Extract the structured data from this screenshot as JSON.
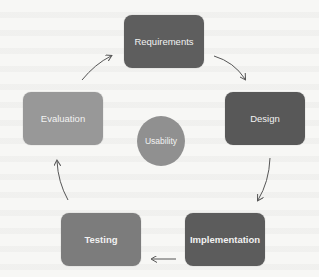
{
  "diagram": {
    "type": "cycle",
    "title": "",
    "center": {
      "label": "Usability",
      "color": "#909090"
    },
    "nodes": [
      {
        "id": "requirements",
        "label": "Requirements",
        "color": "#5e5e5e",
        "bold": false
      },
      {
        "id": "design",
        "label": "Design",
        "color": "#585858",
        "bold": false
      },
      {
        "id": "implementation",
        "label": "Implementation",
        "color": "#5c5c5c",
        "bold": true
      },
      {
        "id": "testing",
        "label": "Testing",
        "color": "#7c7c7c",
        "bold": true
      },
      {
        "id": "evaluation",
        "label": "Evaluation",
        "color": "#989898",
        "bold": false
      }
    ],
    "edges": [
      {
        "from": "requirements",
        "to": "design"
      },
      {
        "from": "design",
        "to": "implementation"
      },
      {
        "from": "implementation",
        "to": "testing"
      },
      {
        "from": "testing",
        "to": "evaluation"
      },
      {
        "from": "evaluation",
        "to": "requirements"
      }
    ],
    "arrow_color": "#555555",
    "background": "#f7f7f5"
  }
}
